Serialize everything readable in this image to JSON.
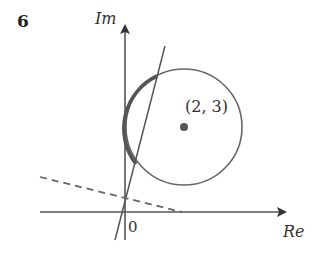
{
  "question_number": "6",
  "axes": {
    "imaginary_label": "Im",
    "real_label": "Re",
    "origin_label": "0"
  },
  "circle": {
    "center_label": "(2, 3)",
    "center": [
      2,
      3
    ]
  },
  "colors": {
    "ink": "#555555",
    "text": "#333333",
    "background": "#ffffff"
  }
}
